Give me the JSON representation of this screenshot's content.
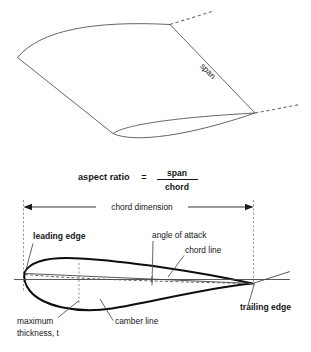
{
  "figure": {
    "title_present": false,
    "background_color": "#ffffff",
    "line_color": "#55555a",
    "bold_line_color": "#0d0d0d",
    "text_color": "#161619"
  },
  "planform": {
    "name": "wing-planform-perspective",
    "span_label": "span",
    "description_parts": [
      "wing-outline",
      "tip-extension-dashed-upper",
      "tip-extension-dashed-lower",
      "root-chord-curve"
    ]
  },
  "formula": {
    "lead_text": "aspect ratio",
    "equals": "=",
    "numerator": "span",
    "denominator": "chord"
  },
  "airfoil": {
    "name": "airfoil-cross-section",
    "labels": {
      "chord_dimension": "chord dimension",
      "leading_edge": "leading edge",
      "trailing_edge": "trailing edge",
      "angle_of_attack": "angle of attack",
      "chord_line": "chord line",
      "camber_line": "camber line",
      "maximum_thickness_line1": "maximum",
      "maximum_thickness_line2": "thickness, t"
    }
  }
}
